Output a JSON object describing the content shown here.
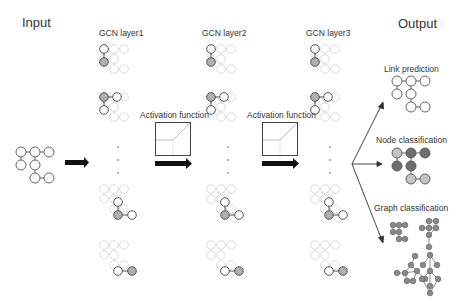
{
  "labels": {
    "input": "Input",
    "output": "Output",
    "layers": [
      "GCN layer1",
      "GCN layer2",
      "GCN layer3"
    ],
    "activation": [
      "Activation function",
      "Activation function"
    ],
    "tasks": [
      "Link prediction",
      "Node classification",
      "Graph classification"
    ]
  },
  "colors": {
    "node_stroke": "#555555",
    "node_fill": "#ffffff",
    "highlight_fill": "#b0b0b0",
    "faded_stroke": "#dddddd",
    "dark_class": "#6e6e6e",
    "light_class": "#c4c4c4",
    "graph_class_node": "#8a8a8a",
    "arrow": "#111111"
  }
}
